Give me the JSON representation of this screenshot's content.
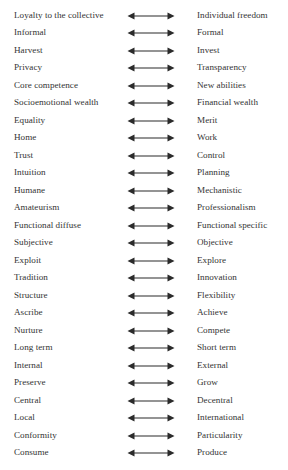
{
  "diagram": {
    "arrow_icon": "double-headed-arrow-icon",
    "colors": {
      "background": "#ffffff",
      "text": "#333333",
      "arrow": "#2b2b2b"
    },
    "rows": [
      {
        "left": "Loyalty to the collective",
        "right": "Individual freedom"
      },
      {
        "left": "Informal",
        "right": "Formal"
      },
      {
        "left": "Harvest",
        "right": "Invest"
      },
      {
        "left": "Privacy",
        "right": "Transparency"
      },
      {
        "left": "Core competence",
        "right": "New abilities"
      },
      {
        "left": "Socioemotional wealth",
        "right": "Financial wealth"
      },
      {
        "left": "Equality",
        "right": "Merit"
      },
      {
        "left": "Home",
        "right": "Work"
      },
      {
        "left": "Trust",
        "right": "Control"
      },
      {
        "left": "Intuition",
        "right": "Planning"
      },
      {
        "left": "Humane",
        "right": "Mechanistic"
      },
      {
        "left": "Amateurism",
        "right": "Professionalism"
      },
      {
        "left": "Functional diffuse",
        "right": "Functional specific"
      },
      {
        "left": "Subjective",
        "right": "Objective"
      },
      {
        "left": "Exploit",
        "right": "Explore"
      },
      {
        "left": "Tradition",
        "right": "Innovation"
      },
      {
        "left": "Structure",
        "right": "Flexibility"
      },
      {
        "left": "Ascribe",
        "right": "Achieve"
      },
      {
        "left": "Nurture",
        "right": "Compete"
      },
      {
        "left": "Long term",
        "right": "Short term"
      },
      {
        "left": "Internal",
        "right": "External"
      },
      {
        "left": "Preserve",
        "right": "Grow"
      },
      {
        "left": "Central",
        "right": "Decentral"
      },
      {
        "left": "Local",
        "right": "International"
      },
      {
        "left": "Conformity",
        "right": "Particularity"
      },
      {
        "left": "Consume",
        "right": "Produce"
      }
    ]
  }
}
